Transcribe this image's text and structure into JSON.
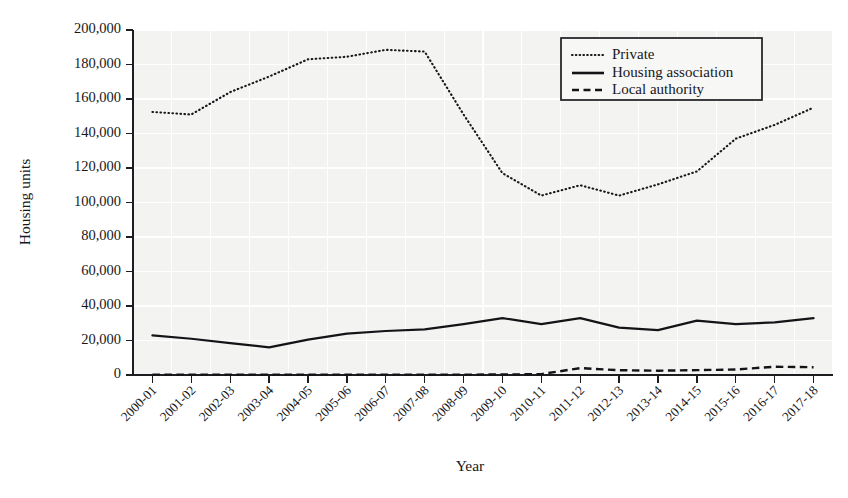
{
  "chart_data": {
    "type": "line",
    "title": "",
    "xlabel": "Year",
    "ylabel": "Housing units",
    "ylim": [
      0,
      200000
    ],
    "yticks": [
      0,
      20000,
      40000,
      60000,
      80000,
      100000,
      120000,
      140000,
      160000,
      180000,
      200000
    ],
    "ytick_labels": [
      "0",
      "20,000",
      "40,000",
      "60,000",
      "80,000",
      "100,000",
      "120,000",
      "140,000",
      "160,000",
      "180,000",
      "200,000"
    ],
    "grid": true,
    "legend_position": "top-right",
    "categories": [
      "2000-01",
      "2001-02",
      "2002-03",
      "2003-04",
      "2004-05",
      "2005-06",
      "2006-07",
      "2007-08",
      "2008-09",
      "2009-10",
      "2010-11",
      "2011-12",
      "2012-13",
      "2013-14",
      "2014-15",
      "2015-16",
      "2016-17",
      "2017-18"
    ],
    "series": [
      {
        "name": "Private",
        "style": "dotted",
        "values": [
          152500,
          151000,
          164000,
          173000,
          183000,
          184500,
          188500,
          187500,
          151000,
          117000,
          104000,
          110000,
          104000,
          110500,
          118000,
          137000,
          145000,
          155000
        ]
      },
      {
        "name": "Housing association",
        "style": "solid",
        "values": [
          23000,
          21000,
          18500,
          16000,
          20500,
          24000,
          25500,
          26500,
          29500,
          33000,
          29500,
          33000,
          27500,
          26000,
          31500,
          29500,
          30500,
          33000
        ]
      },
      {
        "name": "Local authority",
        "style": "dashed",
        "values": [
          200,
          200,
          200,
          200,
          200,
          200,
          200,
          200,
          200,
          300,
          500,
          4000,
          2800,
          2500,
          2800,
          3200,
          4800,
          4500
        ]
      }
    ]
  },
  "legend": {
    "items": [
      {
        "label": "Private"
      },
      {
        "label": "Housing association"
      },
      {
        "label": "Local authority"
      }
    ]
  },
  "axes": {
    "y_title": "Housing units",
    "x_title": "Year"
  }
}
